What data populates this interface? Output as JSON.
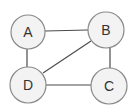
{
  "diagram": {
    "type": "undirected-graph",
    "colors": {
      "node_fill": "#f3f3f3",
      "node_stroke": "#8a8a8a",
      "edge": "#4a4a4a",
      "label": "#333333"
    },
    "nodes": [
      {
        "id": "A",
        "label": "A",
        "cx": 28,
        "cy": 32,
        "r": 17
      },
      {
        "id": "B",
        "label": "B",
        "cx": 106,
        "cy": 30,
        "r": 18
      },
      {
        "id": "C",
        "label": "C",
        "cx": 109,
        "cy": 86,
        "r": 18
      },
      {
        "id": "D",
        "label": "D",
        "cx": 28,
        "cy": 85,
        "r": 18
      }
    ],
    "edges": [
      {
        "from": "A",
        "to": "B"
      },
      {
        "from": "A",
        "to": "D"
      },
      {
        "from": "B",
        "to": "D"
      },
      {
        "from": "B",
        "to": "C"
      },
      {
        "from": "D",
        "to": "C"
      }
    ]
  }
}
